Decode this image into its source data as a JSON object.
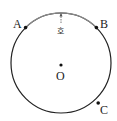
{
  "diagram": {
    "type": "circle",
    "center": {
      "label": "O",
      "x": 61,
      "y": 63
    },
    "radius": 50,
    "points": [
      {
        "label": "A",
        "x": 25,
        "y": 28
      },
      {
        "label": "B",
        "x": 98,
        "y": 28
      },
      {
        "label": "C",
        "x": 99,
        "y": 103
      }
    ],
    "arc_label": "호",
    "arc_color": "#888888",
    "circle_color": "#222222"
  }
}
